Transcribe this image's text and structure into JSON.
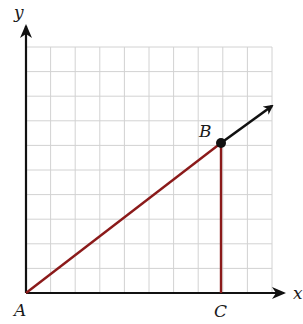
{
  "diagram": {
    "type": "coordinate-grid-triangle",
    "axes": {
      "x_label": "x",
      "y_label": "y"
    },
    "grid": {
      "columns": 10,
      "rows": 10,
      "origin_px": [
        26,
        293
      ],
      "cell_px": 24.6,
      "line_color": "#d2d2d2"
    },
    "points": [
      {
        "name": "A",
        "label": "A",
        "grid": [
          0,
          0
        ]
      },
      {
        "name": "B",
        "label": "B",
        "grid": [
          8,
          6
        ]
      },
      {
        "name": "C",
        "label": "C",
        "grid": [
          8,
          0
        ]
      }
    ],
    "segments": [
      {
        "from": "A",
        "to": "B",
        "color": "#8b1a1a"
      },
      {
        "from": "B",
        "to": "C",
        "color": "#8b1a1a"
      }
    ],
    "ray": {
      "from": "B",
      "direction": "continues AB beyond B",
      "color": "#111111"
    },
    "colors": {
      "axis": "#111111",
      "segment": "#8b1a1a",
      "point": "#111111"
    }
  }
}
